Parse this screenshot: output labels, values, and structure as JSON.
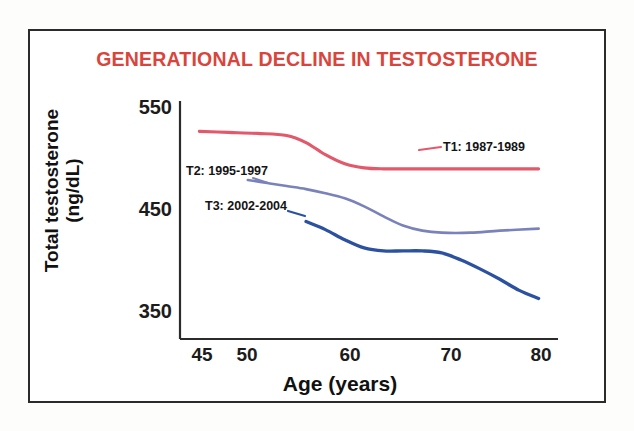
{
  "figure": {
    "border_color": "#2b2b2b",
    "background": "#ffffff"
  },
  "chart_data": {
    "type": "line",
    "title": "GENERATIONAL DECLINE IN TESTOSTERONE",
    "title_color": "#d9453c",
    "xlabel": "Age (years)",
    "ylabel_line1": "Total testosterone",
    "ylabel_line2": "(ng/dL)",
    "ylabel": "Total testosterone (ng/dL)",
    "xlim": [
      43,
      82
    ],
    "ylim": [
      330,
      565
    ],
    "xticks": [
      45,
      50,
      60,
      70,
      80
    ],
    "xtick_labels": [
      "45",
      "50",
      "60",
      "70",
      "80"
    ],
    "yticks": [
      350,
      450,
      550
    ],
    "ytick_labels": [
      "350",
      "450",
      "550"
    ],
    "grid": false,
    "legend_position": "inline-annotations",
    "series": [
      {
        "name": "T1: 1987-1989",
        "label": "T1: 1987-1989",
        "color": "#e2596b",
        "x": [
          45,
          48,
          51,
          54,
          56,
          58,
          60,
          62,
          64,
          67,
          70,
          74,
          78,
          80
        ],
        "values": [
          535,
          534,
          533,
          531,
          524,
          512,
          503,
          499,
          498,
          498,
          498,
          498,
          498,
          498
        ]
      },
      {
        "name": "T2: 1995-1997",
        "label": "T2: 1995-1997",
        "color": "#7a82bb",
        "x": [
          50,
          52,
          54,
          56,
          58,
          60,
          62,
          64,
          66,
          68,
          70,
          73,
          76,
          80
        ],
        "values": [
          487,
          484,
          481,
          478,
          474,
          469,
          461,
          451,
          442,
          437,
          435,
          435,
          437,
          439
        ]
      },
      {
        "name": "T3: 2002-2004",
        "label": "T3: 2002-2004",
        "color": "#2b51a0",
        "x": [
          56,
          58,
          60,
          62,
          64,
          66,
          68,
          70,
          72,
          74,
          76,
          78,
          80
        ],
        "values": [
          446,
          438,
          428,
          420,
          417,
          417,
          417,
          415,
          408,
          399,
          389,
          378,
          370
        ]
      }
    ]
  }
}
